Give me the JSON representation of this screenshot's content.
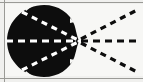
{
  "figure": {
    "kind": "scanned-diagram",
    "caption": "",
    "title": "",
    "canvas": {
      "width": 143,
      "height": 82,
      "background_color": "#f7f7f5",
      "ink_color": "#0d0d0d",
      "highlight_color": "#ffffff"
    },
    "frame": {
      "top_rule": true,
      "bottom_rule": true,
      "left_rule": true,
      "right_rule": false,
      "rule_color": "#9a9a96"
    },
    "blob": {
      "name": "filled-black-blob",
      "fill_color": "#0d0d0d",
      "center_x": 44,
      "center_y": 41,
      "radius_x": 38,
      "radius_y": 36,
      "apex_x": 79,
      "apex_y": 41,
      "description": "solid black rounded mass with pointed right apex"
    },
    "focus_point": {
      "name": "convergence-point",
      "x": 79,
      "y": 41
    },
    "rays": [
      {
        "id": "inner-upper-ray",
        "style": "dashed",
        "color": "#ffffff",
        "from_x": 22,
        "from_y": 12,
        "to_x": 78,
        "to_y": 40
      },
      {
        "id": "inner-middle-ray",
        "style": "dashed",
        "color": "#ffffff",
        "from_x": 6,
        "from_y": 41,
        "to_x": 78,
        "to_y": 41
      },
      {
        "id": "inner-lower-ray",
        "style": "dashed",
        "color": "#ffffff",
        "from_x": 22,
        "from_y": 70,
        "to_x": 78,
        "to_y": 42
      },
      {
        "id": "outer-upper-ray",
        "style": "dashed",
        "color": "#0d0d0d",
        "from_x": 81,
        "from_y": 39,
        "to_x": 139,
        "to_y": 9
      },
      {
        "id": "outer-middle-ray",
        "style": "dashed",
        "color": "#0d0d0d",
        "from_x": 81,
        "from_y": 41,
        "to_x": 141,
        "to_y": 41
      },
      {
        "id": "outer-lower-ray",
        "style": "dashed",
        "color": "#0d0d0d",
        "from_x": 81,
        "from_y": 43,
        "to_x": 139,
        "to_y": 73
      }
    ],
    "alt_text": "Black irregular oval shape with three white dashed lines converging to a point at its right tip, where three black dashed lines diverge outward to the right."
  }
}
